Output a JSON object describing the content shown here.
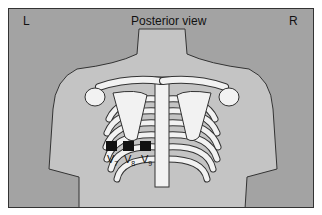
{
  "diagram": {
    "title": "Posterior view",
    "left_label": "L",
    "right_label": "R",
    "electrodes": [
      {
        "lead": "V",
        "sub": "7"
      },
      {
        "lead": "V",
        "sub": "8"
      },
      {
        "lead": "V",
        "sub": "9"
      }
    ],
    "colors": {
      "background": "#a3a3a3",
      "body": "#c4c4c4",
      "bone": "#f2f2f2",
      "electrode": "#111111"
    }
  }
}
